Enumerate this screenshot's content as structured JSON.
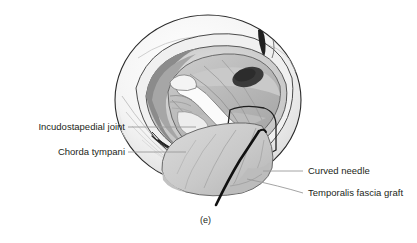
{
  "figure": {
    "caption": "(e)"
  },
  "labels": {
    "left": [
      {
        "id": "incudostapedial-joint",
        "text": "Incudostapedial joint",
        "x": 10,
        "y": 122,
        "leader_x1": 128,
        "leader_y1": 127,
        "leader_x2": 196,
        "leader_y2": 127
      },
      {
        "id": "chorda-tympani",
        "text": "Chorda tympani",
        "x": 35,
        "y": 147,
        "leader_x1": 128,
        "leader_y1": 152,
        "leader_x2": 186,
        "leader_y2": 152
      }
    ],
    "right": [
      {
        "id": "curved-needle",
        "text": "Curved needle",
        "x": 308,
        "y": 166,
        "leader_x1": 263,
        "leader_y1": 171,
        "leader_x2": 303,
        "leader_y2": 171
      },
      {
        "id": "temporalis-fascia-graft",
        "text": "Temporalis fascia graft",
        "x": 308,
        "y": 188,
        "leader_x1": 247,
        "leader_y1": 179,
        "leader_x2": 303,
        "leader_y2": 193
      }
    ]
  },
  "caption_position": {
    "x": 200,
    "y": 224
  },
  "colors": {
    "text": "#231f20",
    "leader_line": "#9a9a9a",
    "outline_dark": "#1a1a1a",
    "sphere_outer": "#f2f2f2",
    "sphere_shade": "#e3e3e3",
    "canal_mid": "#c9c9c9",
    "canal_dark": "#8f8f8f",
    "membrane": "#b5b5b5",
    "membrane_light": "#d4d4d4",
    "ossicle_white": "#fafafa",
    "cavity_dark": "#3a3a3a",
    "graft": "#cfcfcf",
    "graft_shade": "#bdbdbd",
    "needle": "#111111",
    "background": "#ffffff"
  }
}
